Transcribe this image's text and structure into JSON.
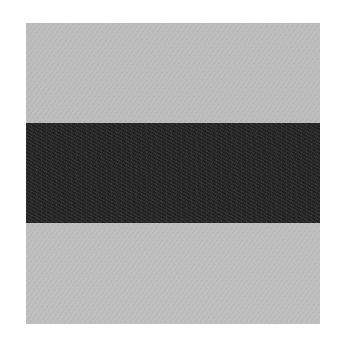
{
  "image": {
    "subject": "fabric or paper swatch with three horizontal bands",
    "background_color": "#ffffff",
    "swatch": {
      "bands": [
        {
          "position": "top",
          "tone": "light gray",
          "color": "#bcbcbc"
        },
        {
          "position": "middle",
          "tone": "dark charcoal",
          "color": "#272727"
        },
        {
          "position": "bottom",
          "tone": "light gray",
          "color": "#bebebe"
        }
      ]
    }
  }
}
